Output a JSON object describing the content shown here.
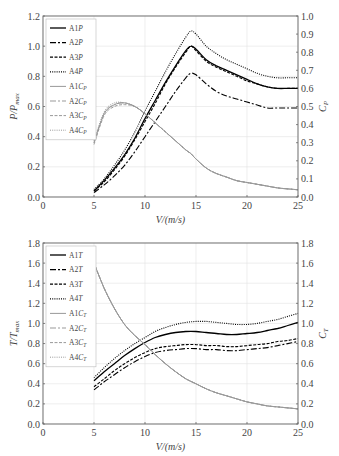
{
  "chart_data": [
    {
      "type": "line",
      "title": "",
      "xlabel": "V/(m/s)",
      "ylabel": "P/P_max",
      "ylabel_right": "C_P",
      "xlim": [
        0,
        25
      ],
      "ylim": [
        0,
        1.2
      ],
      "ylim_right": [
        0,
        1.0
      ],
      "xticks": [
        "0",
        "5",
        "10",
        "15",
        "20",
        "25"
      ],
      "yticks": [
        "0.0",
        "0.2",
        "0.4",
        "0.6",
        "0.8",
        "1.0",
        "1.2"
      ],
      "yticks_right": [
        "0.0",
        "0.1",
        "0.2",
        "0.3",
        "0.4",
        "0.5",
        "0.6",
        "0.7",
        "0.8",
        "0.9",
        "1.0"
      ],
      "grid": true,
      "legend_position": "upper left",
      "x": [
        5,
        6,
        7,
        8,
        9,
        10,
        11,
        12,
        13,
        14,
        14.5,
        15,
        16,
        17,
        18,
        19,
        20,
        21,
        22,
        23,
        24,
        25
      ],
      "series": [
        {
          "name": "A1P",
          "axis": "left",
          "style": "solid",
          "color": "#000000",
          "values": [
            0.04,
            0.11,
            0.19,
            0.28,
            0.39,
            0.52,
            0.64,
            0.76,
            0.87,
            0.97,
            1.0,
            0.98,
            0.91,
            0.87,
            0.84,
            0.81,
            0.78,
            0.75,
            0.73,
            0.72,
            0.72,
            0.72
          ]
        },
        {
          "name": "A2P",
          "axis": "left",
          "style": "dashdot",
          "color": "#000000",
          "values": [
            0.03,
            0.08,
            0.14,
            0.21,
            0.3,
            0.4,
            0.5,
            0.6,
            0.7,
            0.79,
            0.82,
            0.81,
            0.75,
            0.7,
            0.67,
            0.65,
            0.63,
            0.61,
            0.59,
            0.59,
            0.59,
            0.59
          ]
        },
        {
          "name": "A3P",
          "axis": "left",
          "style": "dashed",
          "color": "#000000",
          "values": [
            0.04,
            0.1,
            0.18,
            0.27,
            0.38,
            0.5,
            0.62,
            0.75,
            0.86,
            0.96,
            1.0,
            0.97,
            0.9,
            0.86,
            0.83,
            0.8,
            0.77,
            0.75,
            0.73,
            0.72,
            0.72,
            0.72
          ]
        },
        {
          "name": "A4P",
          "axis": "left",
          "style": "dotted",
          "color": "#000000",
          "values": [
            0.05,
            0.12,
            0.21,
            0.31,
            0.43,
            0.57,
            0.7,
            0.83,
            0.95,
            1.06,
            1.1,
            1.08,
            1.0,
            0.95,
            0.91,
            0.88,
            0.85,
            0.82,
            0.8,
            0.79,
            0.79,
            0.79
          ]
        },
        {
          "name": "A1C_P",
          "axis": "right",
          "style": "solid",
          "color": "#999999",
          "values": [
            0.3,
            0.46,
            0.51,
            0.52,
            0.5,
            0.46,
            0.41,
            0.36,
            0.31,
            0.26,
            0.24,
            0.21,
            0.16,
            0.13,
            0.11,
            0.09,
            0.08,
            0.07,
            0.06,
            0.05,
            0.045,
            0.04
          ]
        },
        {
          "name": "A2C_P",
          "axis": "right",
          "style": "dashdot",
          "color": "#999999",
          "values": [
            0.3,
            0.46,
            0.51,
            0.52,
            0.5,
            0.46,
            0.41,
            0.36,
            0.31,
            0.26,
            0.24,
            0.21,
            0.16,
            0.13,
            0.11,
            0.09,
            0.08,
            0.07,
            0.06,
            0.05,
            0.045,
            0.04
          ]
        },
        {
          "name": "A3C_P",
          "axis": "right",
          "style": "dashed",
          "color": "#999999",
          "values": [
            0.29,
            0.45,
            0.5,
            0.51,
            0.5,
            0.46,
            0.41,
            0.36,
            0.31,
            0.26,
            0.24,
            0.21,
            0.16,
            0.13,
            0.11,
            0.09,
            0.08,
            0.07,
            0.06,
            0.05,
            0.045,
            0.04
          ]
        },
        {
          "name": "A4C_P",
          "axis": "right",
          "style": "dotted",
          "color": "#999999",
          "values": [
            0.31,
            0.47,
            0.52,
            0.52,
            0.5,
            0.46,
            0.41,
            0.36,
            0.31,
            0.26,
            0.24,
            0.21,
            0.16,
            0.13,
            0.11,
            0.09,
            0.08,
            0.07,
            0.06,
            0.05,
            0.045,
            0.04
          ]
        }
      ]
    },
    {
      "type": "line",
      "title": "",
      "xlabel": "V/(m/s)",
      "ylabel": "T/T_max",
      "ylabel_right": "C_T",
      "xlim": [
        0,
        25
      ],
      "ylim": [
        0,
        1.8
      ],
      "ylim_right": [
        0,
        1.8
      ],
      "xticks": [
        "0",
        "5",
        "10",
        "15",
        "20",
        "25"
      ],
      "yticks": [
        "0.0",
        "0.2",
        "0.4",
        "0.6",
        "0.8",
        "1.0",
        "1.2",
        "1.4",
        "1.6",
        "1.8"
      ],
      "yticks_right": [
        "0.0",
        "0.2",
        "0.4",
        "0.6",
        "0.8",
        "1.0",
        "1.2",
        "1.4",
        "1.6",
        "1.8"
      ],
      "grid": true,
      "legend_position": "upper left",
      "x": [
        5,
        6,
        7,
        8,
        9,
        10,
        11,
        12,
        13,
        14,
        15,
        16,
        17,
        18,
        19,
        20,
        21,
        22,
        23,
        24,
        25
      ],
      "series": [
        {
          "name": "A1T",
          "axis": "left",
          "style": "solid",
          "color": "#000000",
          "values": [
            0.43,
            0.52,
            0.6,
            0.68,
            0.75,
            0.81,
            0.86,
            0.89,
            0.91,
            0.92,
            0.92,
            0.91,
            0.9,
            0.89,
            0.89,
            0.9,
            0.91,
            0.93,
            0.95,
            0.98,
            1.01
          ]
        },
        {
          "name": "A2T",
          "axis": "left",
          "style": "dashdot",
          "color": "#000000",
          "values": [
            0.34,
            0.42,
            0.49,
            0.56,
            0.62,
            0.67,
            0.71,
            0.73,
            0.74,
            0.75,
            0.75,
            0.74,
            0.74,
            0.73,
            0.73,
            0.74,
            0.75,
            0.76,
            0.78,
            0.8,
            0.82
          ]
        },
        {
          "name": "A3T",
          "axis": "left",
          "style": "dashed",
          "color": "#000000",
          "values": [
            0.37,
            0.45,
            0.53,
            0.6,
            0.66,
            0.71,
            0.75,
            0.77,
            0.78,
            0.79,
            0.79,
            0.78,
            0.78,
            0.77,
            0.77,
            0.78,
            0.79,
            0.8,
            0.82,
            0.83,
            0.85
          ]
        },
        {
          "name": "A4T",
          "axis": "left",
          "style": "dotted",
          "color": "#000000",
          "values": [
            0.46,
            0.56,
            0.65,
            0.73,
            0.8,
            0.86,
            0.92,
            0.96,
            0.99,
            1.01,
            1.02,
            1.02,
            1.01,
            1.0,
            0.99,
            0.99,
            1.0,
            1.02,
            1.04,
            1.07,
            1.1
          ]
        },
        {
          "name": "A1C_T",
          "axis": "right",
          "style": "solid",
          "color": "#999999",
          "values": [
            1.6,
            1.35,
            1.15,
            0.99,
            0.88,
            0.79,
            0.69,
            0.6,
            0.52,
            0.45,
            0.4,
            0.35,
            0.31,
            0.28,
            0.25,
            0.22,
            0.2,
            0.18,
            0.17,
            0.16,
            0.15
          ]
        },
        {
          "name": "A2C_T",
          "axis": "right",
          "style": "dashdot",
          "color": "#999999",
          "values": [
            1.6,
            1.35,
            1.15,
            0.99,
            0.88,
            0.79,
            0.69,
            0.6,
            0.52,
            0.45,
            0.4,
            0.35,
            0.31,
            0.28,
            0.25,
            0.22,
            0.2,
            0.18,
            0.17,
            0.16,
            0.15
          ]
        },
        {
          "name": "A3C_T",
          "axis": "right",
          "style": "dashed",
          "color": "#999999",
          "values": [
            1.6,
            1.35,
            1.15,
            0.99,
            0.88,
            0.79,
            0.69,
            0.6,
            0.52,
            0.45,
            0.4,
            0.35,
            0.31,
            0.28,
            0.25,
            0.22,
            0.2,
            0.18,
            0.17,
            0.16,
            0.15
          ]
        },
        {
          "name": "A4C_T",
          "axis": "right",
          "style": "dotted",
          "color": "#999999",
          "values": [
            1.6,
            1.35,
            1.15,
            0.99,
            0.88,
            0.79,
            0.69,
            0.6,
            0.52,
            0.45,
            0.4,
            0.35,
            0.31,
            0.28,
            0.25,
            0.22,
            0.2,
            0.18,
            0.17,
            0.16,
            0.15
          ]
        }
      ]
    }
  ],
  "labels": {
    "top_xlabel": "V/(m/s)",
    "top_ylabel_main": "P/P",
    "top_ylabel_sub": "max",
    "top_ylabel_right": "C",
    "top_ylabel_right_sub": "P",
    "bottom_xlabel": "V/(m/s)",
    "bottom_ylabel_main": "T/T",
    "bottom_ylabel_sub": "max",
    "bottom_ylabel_right": "C",
    "bottom_ylabel_right_sub": "T"
  },
  "legend_top": [
    {
      "label": "A1",
      "sym": "P",
      "sub": ""
    },
    {
      "label": "A2",
      "sym": "P",
      "sub": ""
    },
    {
      "label": "A3",
      "sym": "P",
      "sub": ""
    },
    {
      "label": "A4",
      "sym": "P",
      "sub": ""
    },
    {
      "label": "A1",
      "sym": "C",
      "sub": "P"
    },
    {
      "label": "A2",
      "sym": "C",
      "sub": "P"
    },
    {
      "label": "A3",
      "sym": "C",
      "sub": "P"
    },
    {
      "label": "A4",
      "sym": "C",
      "sub": "P"
    }
  ],
  "legend_bottom": [
    {
      "label": "A1",
      "sym": "T",
      "sub": ""
    },
    {
      "label": "A2",
      "sym": "T",
      "sub": ""
    },
    {
      "label": "A3",
      "sym": "T",
      "sub": ""
    },
    {
      "label": "A4",
      "sym": "T",
      "sub": ""
    },
    {
      "label": "A1",
      "sym": "C",
      "sub": "T"
    },
    {
      "label": "A2",
      "sym": "C",
      "sub": "T"
    },
    {
      "label": "A3",
      "sym": "C",
      "sub": "T"
    },
    {
      "label": "A4",
      "sym": "C",
      "sub": "T"
    }
  ]
}
